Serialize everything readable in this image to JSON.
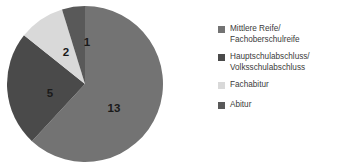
{
  "chart_data": {
    "type": "pie",
    "title": "",
    "categories": [
      "Mittlere Reife/\nFachoberschulreife",
      "Hauptschulabschluss/\nVolksschulabschluss",
      "Fachabitur",
      "Abitur"
    ],
    "values": [
      13,
      5,
      2,
      1
    ],
    "data_labels": [
      "13",
      "5",
      "2",
      "1"
    ],
    "colors": [
      "#737373",
      "#4a4a4a",
      "#d9d9d9",
      "#595959"
    ],
    "total": 21,
    "legend_position": "right",
    "grid": false,
    "xlabel": "",
    "ylabel": "",
    "start_angle_deg": 0,
    "direction": "clockwise"
  },
  "legend": {
    "items": [
      {
        "label": "Mittlere Reife/\nFachoberschulreife",
        "color": "#737373",
        "value": "13"
      },
      {
        "label": "Hauptschulabschluss/\nVolksschulabschluss",
        "color": "#4a4a4a",
        "value": "5"
      },
      {
        "label": "Fachabitur",
        "color": "#d9d9d9",
        "value": "2"
      },
      {
        "label": "Abitur",
        "color": "#595959",
        "value": "1"
      }
    ]
  },
  "pie": {
    "labels": [
      {
        "text": "13",
        "x": 108,
        "y": 104
      },
      {
        "text": "5",
        "x": 44,
        "y": 89
      },
      {
        "text": "2",
        "x": 60,
        "y": 48
      },
      {
        "text": "1",
        "x": 81,
        "y": 38
      }
    ],
    "slices": [
      {
        "name": "mittlere-reife",
        "color": "#737373",
        "d": "M 79 79 L 79 1 A 78 78 0 1 1 22 133 Z"
      },
      {
        "name": "hauptschulabschluss",
        "color": "#4a4a4a",
        "d": "M 79 79 L 22 133 A 78 78 0 0 1 8 45 Z"
      },
      {
        "name": "fachabitur",
        "color": "#d9d9d9",
        "d": "M 79 79 L 8 45 A 78 78 0 0 1 48 10 Z"
      },
      {
        "name": "abitur",
        "color": "#595959",
        "d": "M 79 79 L 48 10 A 78 78 0 0 1 79 1 Z"
      }
    ]
  }
}
